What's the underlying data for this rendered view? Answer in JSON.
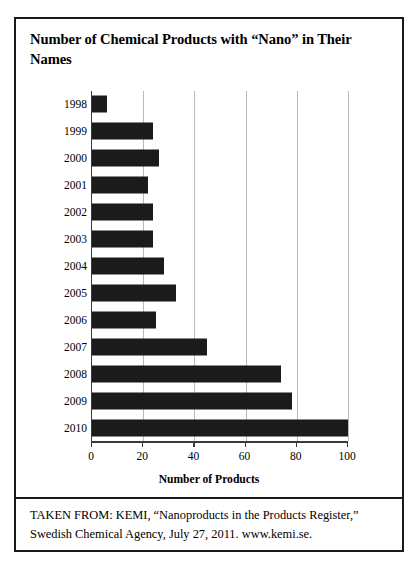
{
  "figure": {
    "title": "Number of Chemical Products with “Nano” in Their Names",
    "caption": "TAKEN FROM: KEMI, “Nanoproducts in the Products Register,” Swedish Chemical Agency, July 27, 2011. www.kemi.se.",
    "border_color": "#1a1a1a"
  },
  "chart_data": {
    "type": "bar",
    "orientation": "horizontal",
    "title": "Number of Chemical Products with “Nano” in Their Names",
    "xlabel": "Number of Products",
    "ylabel": "",
    "categories": [
      "1998",
      "1999",
      "2000",
      "2001",
      "2002",
      "2003",
      "2004",
      "2005",
      "2006",
      "2007",
      "2008",
      "2009",
      "2010"
    ],
    "values": [
      6,
      24,
      26,
      22,
      24,
      24,
      28,
      33,
      25,
      45,
      74,
      78,
      100
    ],
    "xlim": [
      0,
      100
    ],
    "xticks": [
      0,
      20,
      40,
      60,
      80,
      100
    ],
    "xtick_labels": [
      "0",
      "20",
      "40",
      "60",
      "80",
      "100"
    ],
    "grid": "vertical",
    "legend": "none",
    "bar_color": "#1b1b1b",
    "gridline_color": "#b9b9b9",
    "axis_color": "#3a3a3a"
  }
}
